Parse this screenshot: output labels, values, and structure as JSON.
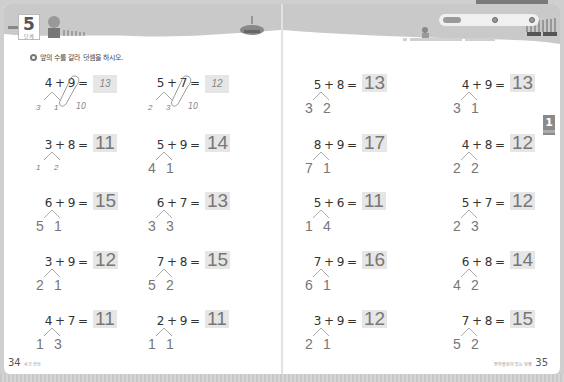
{
  "left_page": {
    "unit": {
      "number": "5",
      "label": "단계"
    },
    "instruction": "앞의 수를 갈라 덧셈을 하시오.",
    "page_number": "34",
    "footer_label": "사고 연산"
  },
  "right_page": {
    "progress": {
      "pill_label": "",
      "dots": [
        "",
        ""
      ]
    },
    "chapter_tab": "1",
    "page_number": "35",
    "footer_label": "받아올림이 있는 덧셈"
  },
  "problems_left": [
    {
      "a": "4",
      "b": "9",
      "answer": "13",
      "split": [
        "3",
        "1"
      ],
      "ten": "10",
      "example": true
    },
    {
      "a": "5",
      "b": "7",
      "answer": "12",
      "split": [
        "2",
        "3"
      ],
      "ten": "10",
      "example": true
    },
    {
      "a": "3",
      "b": "8",
      "answer": "11",
      "split": [
        "1",
        "2"
      ],
      "hand": true
    },
    {
      "a": "5",
      "b": "9",
      "answer": "14",
      "split": [
        "4",
        "1"
      ]
    },
    {
      "a": "6",
      "b": "9",
      "answer": "15",
      "split": [
        "5",
        "1"
      ]
    },
    {
      "a": "6",
      "b": "7",
      "answer": "13",
      "split": [
        "3",
        "3"
      ]
    },
    {
      "a": "3",
      "b": "9",
      "answer": "12",
      "split": [
        "2",
        "1"
      ]
    },
    {
      "a": "7",
      "b": "8",
      "answer": "15",
      "split": [
        "5",
        "2"
      ]
    },
    {
      "a": "4",
      "b": "7",
      "answer": "11",
      "split": [
        "1",
        "3"
      ]
    },
    {
      "a": "2",
      "b": "9",
      "answer": "11",
      "split": [
        "1",
        "1"
      ]
    }
  ],
  "problems_right": [
    {
      "a": "5",
      "b": "8",
      "answer": "13",
      "split": [
        "3",
        "2"
      ]
    },
    {
      "a": "4",
      "b": "9",
      "answer": "13",
      "split": [
        "3",
        "1"
      ]
    },
    {
      "a": "8",
      "b": "9",
      "answer": "17",
      "split": [
        "7",
        "1"
      ]
    },
    {
      "a": "4",
      "b": "8",
      "answer": "12",
      "split": [
        "2",
        "2"
      ]
    },
    {
      "a": "5",
      "b": "6",
      "answer": "11",
      "split": [
        "1",
        "4"
      ]
    },
    {
      "a": "5",
      "b": "7",
      "answer": "12",
      "split": [
        "2",
        "3"
      ]
    },
    {
      "a": "7",
      "b": "9",
      "answer": "16",
      "split": [
        "6",
        "1"
      ]
    },
    {
      "a": "6",
      "b": "8",
      "answer": "14",
      "split": [
        "4",
        "2"
      ]
    },
    {
      "a": "3",
      "b": "9",
      "answer": "12",
      "split": [
        "2",
        "1"
      ]
    },
    {
      "a": "7",
      "b": "8",
      "answer": "15",
      "split": [
        "5",
        "2"
      ]
    }
  ],
  "symbols": {
    "plus": "+",
    "equals": "="
  },
  "colors": {
    "answer_bg": "#e6e6e6",
    "answer_text": "#777777",
    "tab": "#8a8a8a"
  }
}
